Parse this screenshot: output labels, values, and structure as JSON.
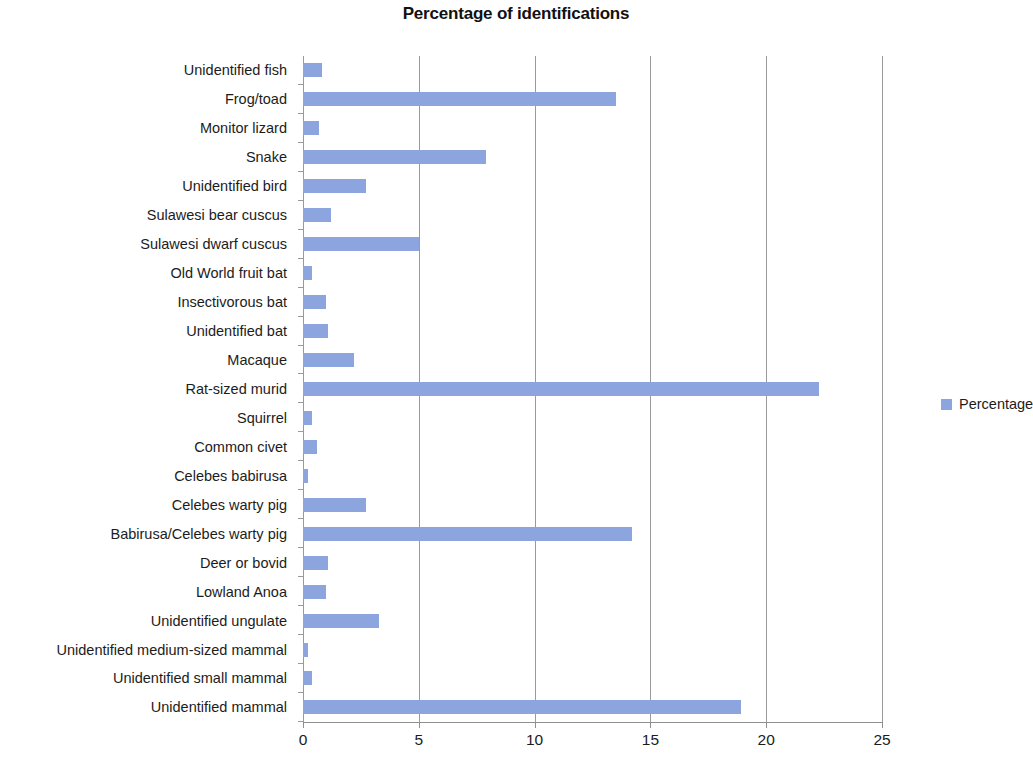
{
  "chart_data": {
    "type": "bar",
    "orientation": "horizontal",
    "title": "Percentage of identifications",
    "xlabel": "",
    "ylabel": "",
    "xlim": [
      0,
      25
    ],
    "xticks": [
      0,
      5,
      10,
      15,
      20,
      25
    ],
    "xtick_labels": [
      "0",
      "5",
      "10",
      "15",
      "20",
      "25"
    ],
    "grid": true,
    "grid_axis": "x",
    "legend": {
      "position": "right",
      "entries": [
        {
          "name": "Percentage",
          "color": "#8CA5DE"
        }
      ]
    },
    "series": [
      {
        "name": "Percentage",
        "color": "#8CA5DE",
        "values": [
          0.8,
          13.5,
          0.7,
          7.9,
          2.7,
          1.2,
          5.0,
          0.4,
          1.0,
          1.1,
          2.2,
          22.3,
          0.4,
          0.6,
          0.2,
          2.7,
          14.2,
          1.1,
          1.0,
          3.3,
          0.2,
          0.4,
          18.9
        ]
      }
    ],
    "categories": [
      "Unidentified fish",
      "Frog/toad",
      "Monitor lizard",
      "Snake",
      "Unidentified bird",
      "Sulawesi bear cuscus",
      "Sulawesi dwarf cuscus",
      "Old World fruit bat",
      "Insectivorous bat",
      "Unidentified bat",
      "Macaque",
      "Rat-sized murid",
      "Squirrel",
      "Common civet",
      "Celebes babirusa",
      "Celebes warty pig",
      "Babirusa/Celebes warty pig",
      "Deer or bovid",
      "Lowland Anoa",
      "Unidentified ungulate",
      "Unidentified medium-sized mammal",
      "Unidentified small mammal",
      "Unidentified mammal"
    ]
  }
}
